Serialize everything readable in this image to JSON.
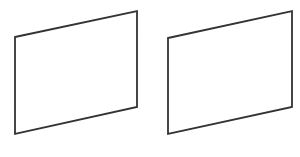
{
  "diagram": {
    "background": "#ffffff",
    "stroke_color": "#333333",
    "stroke_width": 1.8,
    "shapes": [
      {
        "name": "left-panel",
        "type": "parallelogram",
        "points": [
          [
            15,
            37
          ],
          [
            137,
            11
          ],
          [
            137,
            107
          ],
          [
            15,
            134
          ]
        ],
        "fill": "#ffffff"
      },
      {
        "name": "right-panel",
        "type": "parallelogram",
        "points": [
          [
            168,
            38
          ],
          [
            292,
            11
          ],
          [
            292,
            107
          ],
          [
            168,
            134
          ]
        ],
        "fill": "#ffffff"
      }
    ]
  }
}
